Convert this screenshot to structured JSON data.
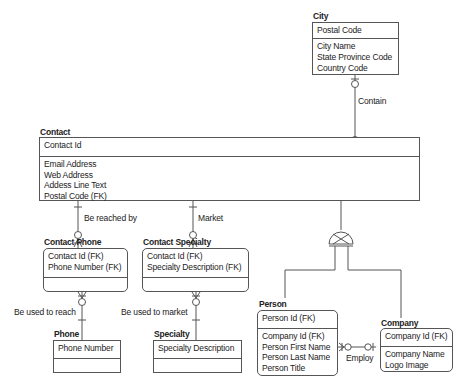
{
  "entities": {
    "city": {
      "name": "City",
      "key": [
        "Postal Code"
      ],
      "attributes": [
        "City Name",
        "State Province Code",
        "Country Code"
      ]
    },
    "contact": {
      "name": "Contact",
      "key": [
        "Contact Id"
      ],
      "attributes": [
        "Email Address",
        "Web Address",
        "Addess Line Text",
        "Postal Code (FK)"
      ]
    },
    "contact_phone": {
      "name": "Contact Phone",
      "key": [
        "Contact Id (FK)",
        "Phone Number (FK)"
      ],
      "attributes": []
    },
    "contact_specialty": {
      "name": "Contact Specialty",
      "key": [
        "Contact Id (FK)",
        "Specialty Description (FK)"
      ],
      "attributes": []
    },
    "phone": {
      "name": "Phone",
      "key": [
        "Phone Number"
      ],
      "attributes": []
    },
    "specialty": {
      "name": "Specialty",
      "key": [
        "Specialty Description"
      ],
      "attributes": []
    },
    "person": {
      "name": "Person",
      "key": [
        "Person Id (FK)"
      ],
      "attributes": [
        "Company Id (FK)",
        "Person First Name",
        "Person Last Name",
        "Person Title"
      ]
    },
    "company": {
      "name": "Company",
      "key": [
        "Company Id (FK)"
      ],
      "attributes": [
        "Company Name",
        "Logo Image"
      ]
    }
  },
  "relationships": {
    "contain": "Contain",
    "be_reached_by": "Be reached by",
    "market": "Market",
    "be_used_to_reach": "Be used to reach",
    "be_used_to_market": "Be used to market",
    "employ": "Employ"
  },
  "subtype": {
    "parent": "Contact",
    "children": [
      "Person",
      "Company"
    ],
    "symbol": "exclusive-subtype"
  },
  "colors": {
    "line": "#555555",
    "text": "#222222",
    "background": "#ffffff"
  }
}
